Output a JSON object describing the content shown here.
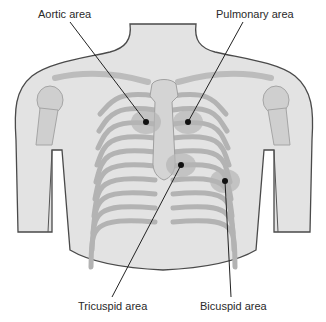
{
  "figure": {
    "colors": {
      "skin": "#e3e3e3",
      "outline": "#4a4a4a",
      "bone": "#d0d0d0",
      "bone_edge": "#9a9a9a",
      "area_shade": "#b5b5b5",
      "dot": "#111111",
      "leader": "#222222"
    },
    "areas": [
      {
        "id": "aortic",
        "label": "Aortic area",
        "label_x": 38,
        "label_y": 8,
        "dot_x": 146,
        "dot_y": 122,
        "line_from_x": 70,
        "line_from_y": 22
      },
      {
        "id": "pulmonary",
        "label": "Pulmonary area",
        "label_x": 216,
        "label_y": 8,
        "dot_x": 188,
        "dot_y": 122,
        "line_from_x": 243,
        "line_from_y": 22
      },
      {
        "id": "tricuspid",
        "label": "Tricuspid area",
        "label_x": 78,
        "label_y": 300,
        "dot_x": 181,
        "dot_y": 165,
        "line_from_x": 112,
        "line_from_y": 297
      },
      {
        "id": "bicuspid",
        "label": "Bicuspid area",
        "label_x": 200,
        "label_y": 300,
        "dot_x": 225,
        "dot_y": 181,
        "line_from_x": 231,
        "line_from_y": 297
      }
    ]
  }
}
